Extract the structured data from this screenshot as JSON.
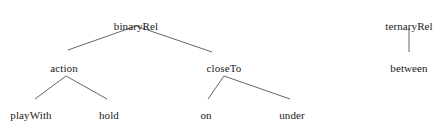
{
  "diagram": {
    "background_color": "#ffffff",
    "edge_color": "#555555",
    "text_color": "#1a1a1a",
    "trees": [
      {
        "name": "binaryRel-tree",
        "root": "binaryRel",
        "nodes": [
          {
            "id": "binaryRel",
            "label": "binaryRel",
            "x": 136,
            "y": 20,
            "level": 0
          },
          {
            "id": "action",
            "label": "action",
            "x": 64,
            "y": 62,
            "level": 1
          },
          {
            "id": "closeTo",
            "label": "closeTo",
            "x": 224,
            "y": 62,
            "level": 1
          },
          {
            "id": "playWith",
            "label": "playWith",
            "x": 31,
            "y": 109,
            "level": 2
          },
          {
            "id": "hold",
            "label": "hold",
            "x": 109,
            "y": 109,
            "level": 2
          },
          {
            "id": "on",
            "label": "on",
            "x": 206,
            "y": 109,
            "level": 2
          },
          {
            "id": "under",
            "label": "under",
            "x": 292,
            "y": 109,
            "level": 2
          }
        ],
        "edges": [
          {
            "from": "binaryRel",
            "to": "action",
            "x1": 136,
            "y1": 26,
            "x2": 68,
            "y2": 50
          },
          {
            "from": "binaryRel",
            "to": "closeTo",
            "x1": 136,
            "y1": 26,
            "x2": 212,
            "y2": 52
          },
          {
            "from": "action",
            "to": "playWith",
            "x1": 66,
            "y1": 76,
            "x2": 35,
            "y2": 99
          },
          {
            "from": "action",
            "to": "hold",
            "x1": 66,
            "y1": 76,
            "x2": 107,
            "y2": 99
          },
          {
            "from": "closeTo",
            "to": "on",
            "x1": 224,
            "y1": 76,
            "x2": 208,
            "y2": 99
          },
          {
            "from": "closeTo",
            "to": "under",
            "x1": 224,
            "y1": 76,
            "x2": 290,
            "y2": 99
          }
        ]
      },
      {
        "name": "ternaryRel-tree",
        "root": "ternaryRel",
        "nodes": [
          {
            "id": "ternaryRel",
            "label": "ternaryRel",
            "x": 409,
            "y": 20,
            "level": 0
          },
          {
            "id": "between",
            "label": "between",
            "x": 409,
            "y": 62,
            "level": 1
          }
        ],
        "edges": [
          {
            "from": "ternaryRel",
            "to": "between",
            "x1": 409,
            "y1": 28,
            "x2": 409,
            "y2": 52
          }
        ]
      }
    ]
  }
}
